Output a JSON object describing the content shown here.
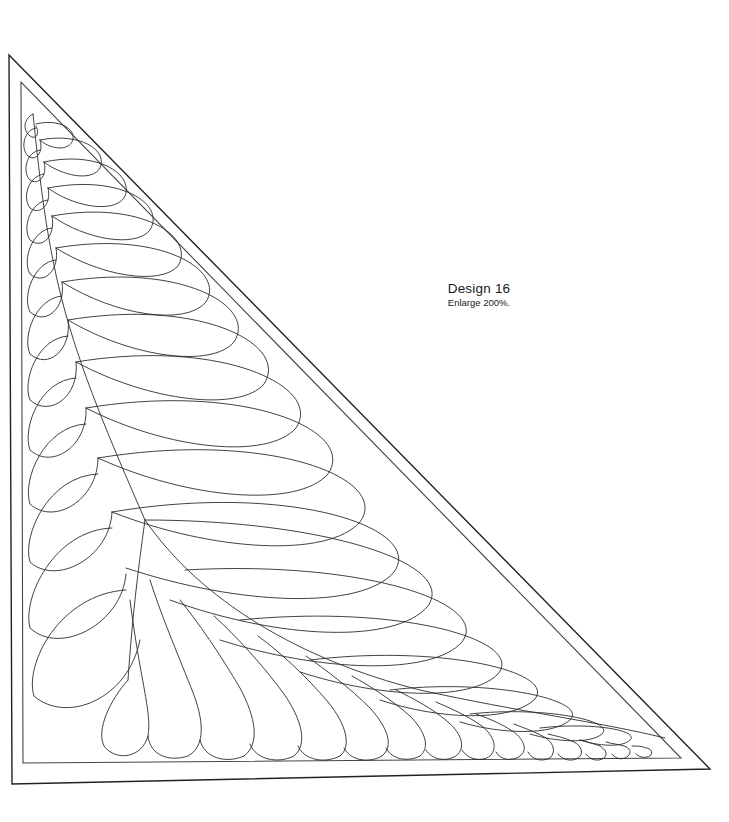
{
  "design": {
    "title": "Design 16",
    "instruction": "Enlarge 200%."
  },
  "colors": {
    "line": "#2b2b2b",
    "background": "#ffffff"
  },
  "geometry": {
    "outer_triangle": [
      [
        9,
        55
      ],
      [
        12,
        784
      ],
      [
        710,
        769
      ]
    ],
    "inner_triangle": [
      [
        21,
        82
      ],
      [
        23,
        763
      ],
      [
        681,
        758
      ]
    ]
  }
}
